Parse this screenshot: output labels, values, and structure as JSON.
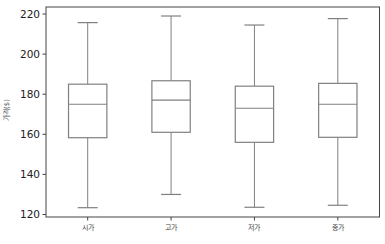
{
  "chart_data": {
    "type": "box",
    "title": "",
    "xlabel": "",
    "ylabel": "가격($)",
    "ylim": [
      119.5,
      223.5
    ],
    "yticks": [
      120,
      140,
      160,
      180,
      200,
      220
    ],
    "grid": false,
    "legend": null,
    "categories": [
      "시가",
      "고가",
      "저가",
      "종가"
    ],
    "series": [
      {
        "name": "시가",
        "whisker_low": 123.4,
        "q1": 158.3,
        "median": 175.0,
        "q3": 185.0,
        "whisker_high": 215.7
      },
      {
        "name": "고가",
        "whisker_low": 130.0,
        "q1": 161.0,
        "median": 177.0,
        "q3": 186.7,
        "whisker_high": 219.0
      },
      {
        "name": "저가",
        "whisker_low": 123.6,
        "q1": 156.0,
        "median": 173.0,
        "q3": 184.0,
        "whisker_high": 214.5
      },
      {
        "name": "종가",
        "whisker_low": 124.6,
        "q1": 158.5,
        "median": 175.0,
        "q3": 185.4,
        "whisker_high": 217.7
      }
    ]
  },
  "style": {
    "box_color": "#808080",
    "axis_color": "#444444",
    "background": "#ffffff"
  }
}
